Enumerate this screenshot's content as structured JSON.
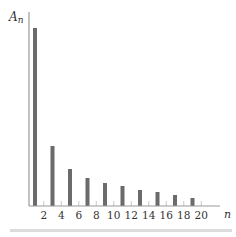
{
  "chart_data": {
    "type": "bar",
    "title": "",
    "ylabel": "A",
    "ylabel_sub": "n",
    "xlabel": "n",
    "x": [
      1,
      3,
      5,
      7,
      9,
      11,
      13,
      15,
      17,
      19
    ],
    "values": [
      178,
      60,
      37,
      28,
      23,
      20,
      16,
      14,
      11,
      8
    ],
    "x_ticks": [
      2,
      4,
      6,
      8,
      10,
      12,
      14,
      16,
      18,
      20
    ],
    "xlim": [
      0,
      21.5
    ],
    "ylim": [
      0,
      195
    ],
    "grid": false,
    "legend": null,
    "colors": {
      "bar": "#6b6b6b",
      "axis": "#9a9a9a",
      "tick": "#c8c8c8",
      "divider": "#dcdcdc"
    }
  }
}
